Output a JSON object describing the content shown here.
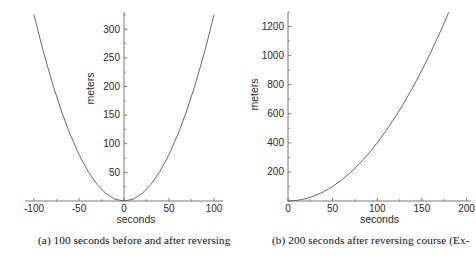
{
  "figure": {
    "panels": [
      {
        "id": "a",
        "caption": "(a) 100 seconds before and after reversing",
        "chart_data": {
          "type": "line",
          "title": "",
          "xlabel": "seconds",
          "ylabel": "meters",
          "xlim": [
            -110,
            110
          ],
          "ylim": [
            0,
            330
          ],
          "xticks": [
            -100,
            -50,
            0,
            50,
            100
          ],
          "xticklabels": [
            "-100",
            "-50",
            "0",
            "50",
            "100"
          ],
          "yticks": [
            50,
            100,
            150,
            200,
            250,
            300
          ],
          "yticklabels": [
            "50",
            "100",
            "150",
            "200",
            "250",
            "300"
          ],
          "grid": false,
          "legend": null,
          "series": [
            {
              "name": "distance",
              "x": [
                -100,
                -90,
                -80,
                -70,
                -60,
                -50,
                -40,
                -30,
                -20,
                -10,
                0,
                10,
                20,
                30,
                40,
                50,
                60,
                70,
                80,
                90,
                100
              ],
              "y": [
                325,
                263,
                208,
                159,
                117,
                81,
                52,
                29,
                13,
                3,
                0,
                3,
                13,
                29,
                52,
                81,
                117,
                159,
                208,
                263,
                325
              ]
            }
          ]
        }
      },
      {
        "id": "b",
        "caption": "(b) 200 seconds after reversing course (Ex-",
        "chart_data": {
          "type": "line",
          "title": "",
          "xlabel": "seconds",
          "ylabel": "meters",
          "xlim": [
            0,
            205
          ],
          "ylim": [
            0,
            1300
          ],
          "xticks": [
            0,
            50,
            100,
            150,
            200
          ],
          "xticklabels": [
            "0",
            "50",
            "100",
            "150",
            "200"
          ],
          "yticks": [
            200,
            400,
            600,
            800,
            1000,
            1200
          ],
          "yticklabels": [
            "200",
            "400",
            "600",
            "800",
            "1000",
            "1200"
          ],
          "grid": false,
          "legend": null,
          "series": [
            {
              "name": "distance",
              "x": [
                0,
                10,
                20,
                30,
                40,
                50,
                60,
                70,
                80,
                90,
                100,
                110,
                120,
                130,
                140,
                150,
                160,
                170,
                180
              ],
              "y": [
                0,
                4,
                16,
                36,
                64,
                100,
                144,
                196,
                256,
                324,
                400,
                484,
                576,
                676,
                784,
                900,
                1024,
                1156,
                1296
              ]
            }
          ]
        }
      }
    ],
    "colors": {
      "curve": "#5b5b5b",
      "axis": "#6b6b6b",
      "text": "#2b2b2b",
      "background": "#ffffff"
    }
  }
}
